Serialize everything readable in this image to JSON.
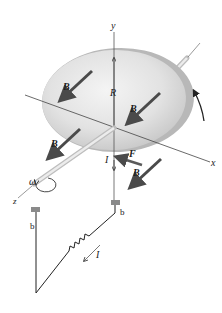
{
  "diagram": {
    "labels": {
      "axis_x": "x",
      "axis_y": "y",
      "axis_z": "z",
      "radius": "R",
      "angular_velocity": "ω",
      "force": "F",
      "current_disk": "I",
      "current_circuit": "I",
      "brush_axle": "b",
      "brush_rim": "b",
      "field_1": "B",
      "field_2": "B",
      "field_3": "B",
      "field_4": "B"
    },
    "colors": {
      "disk_face_light": "#f2f2f2",
      "disk_face_dark": "#c4c4c4",
      "disk_rim": "#b3b3b3",
      "field_arrow": "#4a4a4a",
      "axle": "#d8d8d8",
      "wire": "#222222",
      "brush": "#8a8a8a"
    }
  }
}
